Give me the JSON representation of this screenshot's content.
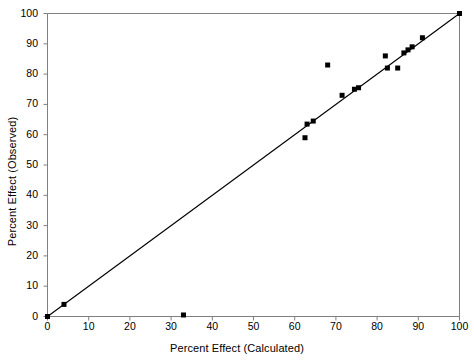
{
  "chart_data": {
    "type": "scatter",
    "title": "",
    "xlabel": "Percent Effect (Calculated)",
    "ylabel": "Percent Effect (Observed)",
    "xlim": [
      0,
      100
    ],
    "ylim": [
      0,
      100
    ],
    "xticks": [
      0,
      10,
      20,
      30,
      40,
      50,
      60,
      70,
      80,
      90,
      100
    ],
    "yticks": [
      0,
      10,
      20,
      30,
      40,
      50,
      60,
      70,
      80,
      90,
      100
    ],
    "xtick_labels": [
      "0",
      "10",
      "20",
      "30",
      "40",
      "50",
      "60",
      "70",
      "80",
      "90",
      "100"
    ],
    "ytick_labels": [
      "0",
      "10",
      "20",
      "30",
      "40",
      "50",
      "60",
      "70",
      "80",
      "90",
      "100"
    ],
    "grid": false,
    "legend": null,
    "marker": "filled-square",
    "marker_color": "#000000",
    "series": [
      {
        "name": "Observed vs Calculated",
        "points": [
          [
            0,
            0
          ],
          [
            4,
            4
          ],
          [
            33,
            0.5
          ],
          [
            62.5,
            59
          ],
          [
            63,
            63.5
          ],
          [
            64.5,
            64.5
          ],
          [
            68,
            83
          ],
          [
            71.5,
            73
          ],
          [
            74.5,
            75
          ],
          [
            75.5,
            75.5
          ],
          [
            82,
            86
          ],
          [
            82.5,
            82
          ],
          [
            85,
            82
          ],
          [
            86.5,
            87
          ],
          [
            87.5,
            88
          ],
          [
            88.5,
            89
          ],
          [
            91,
            92
          ],
          [
            100,
            100
          ]
        ]
      }
    ],
    "reference_line": {
      "name": "identity-line",
      "from": [
        0,
        0
      ],
      "to": [
        100,
        100
      ]
    }
  },
  "axes": {
    "frame_color": "#808080",
    "line_color": "#000000"
  }
}
